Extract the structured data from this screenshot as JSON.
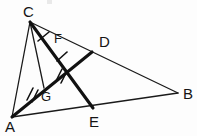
{
  "figure": {
    "canvas": {
      "width": 197,
      "height": 136,
      "background": "#fdfdfd"
    },
    "colors": {
      "stroke": "#1a1a1a",
      "stroke_heavy": "#111111",
      "label": "#141414",
      "background": "#fdfdfd"
    },
    "points": [
      {
        "id": "A",
        "label": "A",
        "x": 12,
        "y": 117,
        "label_x": 5,
        "label_y": 132,
        "role": "vertex"
      },
      {
        "id": "B",
        "label": "B",
        "x": 178,
        "y": 93,
        "label_x": 183,
        "label_y": 99,
        "role": "vertex"
      },
      {
        "id": "C",
        "label": "C",
        "x": 30,
        "y": 22,
        "label_x": 23,
        "label_y": 17,
        "role": "vertex"
      },
      {
        "id": "D",
        "label": "D",
        "x": 92,
        "y": 52,
        "label_x": 99,
        "label_y": 47,
        "role": "point-on-CB"
      },
      {
        "id": "E",
        "label": "E",
        "x": 93,
        "y": 108,
        "label_x": 89,
        "label_y": 127,
        "role": "point-on-AB"
      },
      {
        "id": "F",
        "label": "F",
        "x": 52,
        "y": 45,
        "label_x": 54,
        "label_y": 43,
        "role": "point-on-CE"
      },
      {
        "id": "G",
        "label": "G",
        "x": 44,
        "y": 88,
        "label_x": 41,
        "label_y": 101,
        "role": "intersection"
      }
    ],
    "segments": [
      {
        "id": "AC",
        "from": "A",
        "to": "C",
        "weight": "thin",
        "name": "segment-AC"
      },
      {
        "id": "AB",
        "from": "A",
        "to": "B",
        "weight": "thin",
        "name": "segment-AB"
      },
      {
        "id": "CB",
        "from": "C",
        "to": "B",
        "weight": "thin",
        "name": "segment-CB"
      },
      {
        "id": "CG",
        "from": "C",
        "to": "G",
        "weight": "thin",
        "name": "segment-CG"
      },
      {
        "id": "CE",
        "from": "C",
        "to": "E",
        "weight": "thick",
        "name": "segment-CE"
      },
      {
        "id": "AD",
        "from": "A",
        "to": "D",
        "weight": "thick",
        "name": "segment-AD"
      }
    ],
    "tick_marks": [
      {
        "id": "t1",
        "on": "CF",
        "count": 1,
        "x": 43,
        "y": 36,
        "angle": 50,
        "name": "tick-mark-CF"
      },
      {
        "id": "t2",
        "on": "FG",
        "count": 1,
        "x": 61,
        "y": 56,
        "angle": 50,
        "name": "tick-mark-FG"
      },
      {
        "id": "t3",
        "on": "AG",
        "count": 2,
        "x": 31,
        "y": 94,
        "angle": 58,
        "name": "tick-mark-AG"
      },
      {
        "id": "t4",
        "on": "GX",
        "count": 2,
        "x": 60,
        "y": 74,
        "angle": 58,
        "name": "tick-mark-GX"
      }
    ],
    "artifacts": [
      {
        "id": "smudge-top",
        "x": 47,
        "y": 0,
        "w": 5,
        "h": 4
      }
    ]
  }
}
